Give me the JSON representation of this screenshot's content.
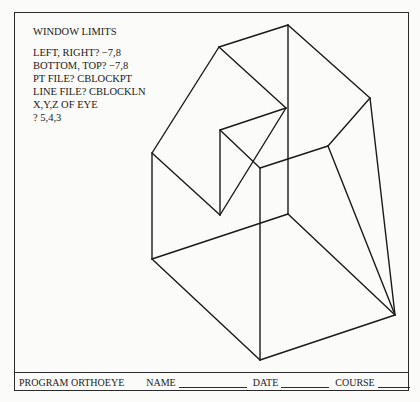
{
  "terminal": {
    "heading": "WINDOW LIMITS",
    "lines": [
      "LEFT, RIGHT?   −7,8",
      "BOTTOM, TOP?  −7,8",
      "PT FILE?  CBLOCKPT",
      "LINE FILE?  CBLOCKLN",
      "X,Y,Z OF EYE",
      "?  5,4,3"
    ]
  },
  "footer": {
    "program": "PROGRAM ORTHOEYE",
    "name_label": "NAME",
    "date_label": "DATE",
    "course_label": "COURSE"
  },
  "drawing": {
    "type": "wireframe-perspective-block",
    "stroke": "#1a1a1a"
  }
}
